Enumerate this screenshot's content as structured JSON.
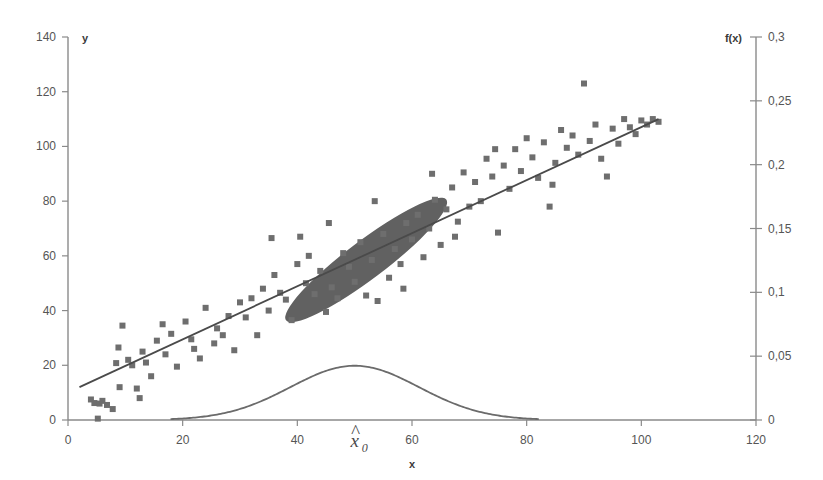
{
  "chart_data": {
    "type": "scatter",
    "title": "",
    "xlabel": "x",
    "ylabel": "y",
    "y2label": "f(x)",
    "xlim": [
      0,
      120
    ],
    "ylim": [
      0,
      140
    ],
    "y2lim": [
      0,
      0.3
    ],
    "grid": false,
    "legend": null,
    "decimal_separator": ",",
    "x_ticks": [
      "0",
      "20",
      "40",
      "60",
      "80",
      "100",
      "120"
    ],
    "x_tick_values": [
      0,
      20,
      40,
      60,
      80,
      100,
      120
    ],
    "y_ticks": [
      "0",
      "20",
      "40",
      "60",
      "80",
      "100",
      "120",
      "140"
    ],
    "y_tick_values": [
      0,
      20,
      40,
      60,
      80,
      100,
      120,
      140
    ],
    "y2_ticks": [
      "0",
      "0,05",
      "0,1",
      "0,15",
      "0,2",
      "0,25",
      "0,3"
    ],
    "y2_tick_values": [
      0,
      0.05,
      0.1,
      0.15,
      0.2,
      0.25,
      0.3
    ],
    "marker": "square",
    "marker_size": 6,
    "marker_color": "#6e6e6e",
    "axis_color": "#8a8a8a",
    "line_color": "#4a4a4a",
    "ellipse_fill": "#616161",
    "curve_color": "#6b6b6b",
    "annotations": [
      {
        "name": "x-hat-zero",
        "text_main": "x",
        "text_hat": "^",
        "text_sub": "0",
        "x": 50,
        "y": -14
      }
    ],
    "series": [
      {
        "name": "observations",
        "type": "scatter",
        "points": [
          [
            4.0,
            7.5
          ],
          [
            4.6,
            6.2
          ],
          [
            5.2,
            0.5
          ],
          [
            5.5,
            6.0
          ],
          [
            6.0,
            7.0
          ],
          [
            7.8,
            4.0
          ],
          [
            8.4,
            20.8
          ],
          [
            8.8,
            26.5
          ],
          [
            9.5,
            34.5
          ],
          [
            10.5,
            22.0
          ],
          [
            11.2,
            20.0
          ],
          [
            12.0,
            11.5
          ],
          [
            13.0,
            25.0
          ],
          [
            13.6,
            21.0
          ],
          [
            14.5,
            16.0
          ],
          [
            15.5,
            29.0
          ],
          [
            16.5,
            35.0
          ],
          [
            17.0,
            24.0
          ],
          [
            18.0,
            31.5
          ],
          [
            19.0,
            19.5
          ],
          [
            20.5,
            36.0
          ],
          [
            21.5,
            29.5
          ],
          [
            22.0,
            26.0
          ],
          [
            23.0,
            22.5
          ],
          [
            24.0,
            41.0
          ],
          [
            25.5,
            28.0
          ],
          [
            26.0,
            33.5
          ],
          [
            27.0,
            31.0
          ],
          [
            28.0,
            38.0
          ],
          [
            29.0,
            25.5
          ],
          [
            30.0,
            43.0
          ],
          [
            31.0,
            37.5
          ],
          [
            32.0,
            44.5
          ],
          [
            33.0,
            31.0
          ],
          [
            34.0,
            48.0
          ],
          [
            35.0,
            40.0
          ],
          [
            36.0,
            53.0
          ],
          [
            37.0,
            46.5
          ],
          [
            38.0,
            44.0
          ],
          [
            39.0,
            36.5
          ],
          [
            40.0,
            57.0
          ],
          [
            40.5,
            67.0
          ],
          [
            41.5,
            50.0
          ],
          [
            42.0,
            60.0
          ],
          [
            43.0,
            46.0
          ],
          [
            44.0,
            54.5
          ],
          [
            45.0,
            39.5
          ],
          [
            46.0,
            48.5
          ],
          [
            47.0,
            44.5
          ],
          [
            48.0,
            61.0
          ],
          [
            49.0,
            56.0
          ],
          [
            50.0,
            50.5
          ],
          [
            51.0,
            65.0
          ],
          [
            52.0,
            45.5
          ],
          [
            53.0,
            58.5
          ],
          [
            54.0,
            43.5
          ],
          [
            55.0,
            68.0
          ],
          [
            56.0,
            52.0
          ],
          [
            57.0,
            62.5
          ],
          [
            58.0,
            57.0
          ],
          [
            59.0,
            72.0
          ],
          [
            60.0,
            66.0
          ],
          [
            61.0,
            75.0
          ],
          [
            62.0,
            59.5
          ],
          [
            63.0,
            70.0
          ],
          [
            64.0,
            80.5
          ],
          [
            65.0,
            64.0
          ],
          [
            66.0,
            77.0
          ],
          [
            67.0,
            85.0
          ],
          [
            68.0,
            72.5
          ],
          [
            69.0,
            90.5
          ],
          [
            70.0,
            78.0
          ],
          [
            71.0,
            87.0
          ],
          [
            72.0,
            80.0
          ],
          [
            73.0,
            95.5
          ],
          [
            74.0,
            89.0
          ],
          [
            75.0,
            68.5
          ],
          [
            76.0,
            93.0
          ],
          [
            77.0,
            84.5
          ],
          [
            78.0,
            99.0
          ],
          [
            79.0,
            91.0
          ],
          [
            80.0,
            103.0
          ],
          [
            81.0,
            96.0
          ],
          [
            82.0,
            88.5
          ],
          [
            83.0,
            101.5
          ],
          [
            84.0,
            78.0
          ],
          [
            85.0,
            94.0
          ],
          [
            86.0,
            106.0
          ],
          [
            87.0,
            99.5
          ],
          [
            88.0,
            104.0
          ],
          [
            89.0,
            97.0
          ],
          [
            90.0,
            123.0
          ],
          [
            91.0,
            102.0
          ],
          [
            92.0,
            108.0
          ],
          [
            93.0,
            95.5
          ],
          [
            94.0,
            89.0
          ],
          [
            95.0,
            106.5
          ],
          [
            96.0,
            101.0
          ],
          [
            97.0,
            110.0
          ],
          [
            98.0,
            107.0
          ],
          [
            99.0,
            104.5
          ],
          [
            100.0,
            109.5
          ],
          [
            101.0,
            108.0
          ],
          [
            102.0,
            110.0
          ],
          [
            103.0,
            109.0
          ],
          [
            12.5,
            8.0
          ],
          [
            6.8,
            5.5
          ],
          [
            9.0,
            12.0
          ],
          [
            45.5,
            72.0
          ],
          [
            35.5,
            66.5
          ],
          [
            67.5,
            67.0
          ],
          [
            53.5,
            80.0
          ],
          [
            58.5,
            48.0
          ],
          [
            63.5,
            90.0
          ],
          [
            84.5,
            86.0
          ],
          [
            74.5,
            99.0
          ]
        ]
      },
      {
        "name": "regression-line",
        "type": "line",
        "x_start": 2.0,
        "y_start": 12.0,
        "x_end": 103.0,
        "y_end": 110.0
      },
      {
        "name": "confidence-ellipse",
        "type": "ellipse",
        "center_x": 52.0,
        "center_y": 58.5,
        "semi_major": 17.5,
        "semi_minor": 7.0,
        "rotation_deg": -37
      },
      {
        "name": "normal-density-curve",
        "type": "line",
        "axis": "right",
        "mean": 50.0,
        "sigma": 11.2,
        "peak": 0.0425,
        "x_min": 18.0,
        "x_max": 82.0
      }
    ]
  },
  "labels": {
    "y_axis_title": "y",
    "x_axis_title": "x",
    "y2_axis_title": "f(x)"
  }
}
